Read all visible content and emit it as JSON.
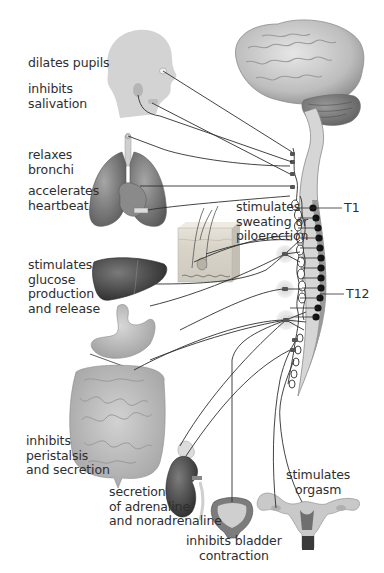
{
  "diagram": {
    "labels": {
      "pupils": "dilates pupils",
      "salivation": "inhibits\nsalivation",
      "bronchi": "relaxes\nbronchi",
      "heartbeat": "accelerates\nheartbeat",
      "sweating": "stimulates\nsweating or\npiloerection",
      "glucose": "stimulates\nglucose\nproduction\nand release",
      "peristalsis": "inhibits\nperistalsis\nand secretion",
      "adrenaline": "secretion\nof adrenaline\nand noradrenaline",
      "bladder": "inhibits bladder\ncontraction",
      "orgasm": "stimulates\norgasm"
    },
    "spinal_segments": {
      "top": "T1",
      "bottom": "T12"
    },
    "organs": [
      "head",
      "brain",
      "spinal-cord",
      "lungs",
      "heart",
      "skin",
      "liver",
      "stomach",
      "intestines",
      "adrenal-kidney",
      "bladder",
      "uterus"
    ],
    "colors": {
      "organ_gray": "#8a8a8a",
      "organ_dark": "#4a4a4a",
      "organ_light": "#d4d4d4",
      "nerve_line": "#3a3a3a",
      "ganglion_dot": "#111111",
      "ganglion_halo": "#d9d9d9"
    }
  }
}
